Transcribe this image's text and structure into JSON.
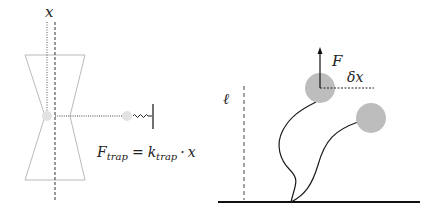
{
  "left_panel": {
    "axis_label": "x",
    "formula": {
      "lhs_main": "F",
      "lhs_sub": "trap",
      "equals": "=",
      "rhs_main": "k",
      "rhs_sub": "trap",
      "dot": "·",
      "rhs_var": "x"
    },
    "elements": [
      "optical-trap-hourglass",
      "trapped-bead",
      "displaced-bead",
      "spring",
      "wall"
    ]
  },
  "right_panel": {
    "length_label": "ℓ",
    "force_label": "F",
    "displacement_label": "δx",
    "elements": [
      "ground-surface",
      "filament-1",
      "filament-2",
      "bead-1",
      "bead-2",
      "force-arrow",
      "displacement-line",
      "length-marker"
    ]
  },
  "colors": {
    "stroke": "#1a1a1a",
    "trap_outline": "#9a9a9a",
    "bead_fill": "#bdbdbd",
    "faint_bead_fill": "#e0e0e0"
  }
}
